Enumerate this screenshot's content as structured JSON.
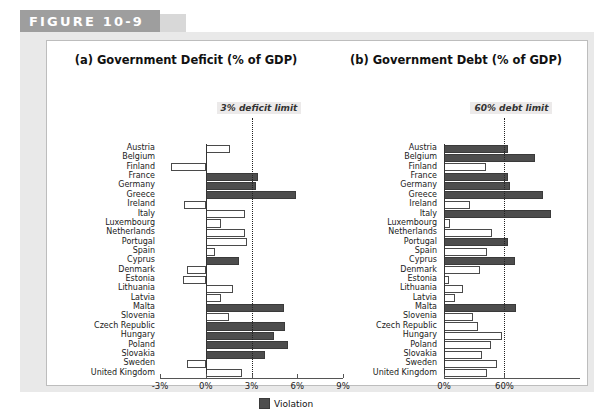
{
  "figure": {
    "tab_label": "FIGURE 10-9"
  },
  "legend": {
    "violation_label": "Violation",
    "violation_color": "#4d4d4d",
    "ok_color": "#ffffff"
  },
  "chart_data": [
    {
      "type": "bar",
      "orientation": "horizontal",
      "title": "(a) Government Deficit (% of GDP)",
      "xlabel": "",
      "ylabel": "",
      "xlim": [
        -3,
        9
      ],
      "xticks": [
        -3,
        0,
        3,
        6,
        9
      ],
      "xticklabels": [
        "-3%",
        "0%",
        "3%",
        "6%",
        "9%"
      ],
      "grid": false,
      "legend_position": "bottom-center",
      "annotation": "3% deficit limit",
      "threshold": 3,
      "threshold_style": "dotted-vertical",
      "categories": [
        "Austria",
        "Belgium",
        "Finland",
        "France",
        "Germany",
        "Greece",
        "Ireland",
        "Italy",
        "Luxembourg",
        "Netherlands",
        "Portugal",
        "Spain",
        "Cyprus",
        "Denmark",
        "Estonia",
        "Lithuania",
        "Latvia",
        "Malta",
        "Slovenia",
        "Czech Republic",
        "Hungary",
        "Poland",
        "Slovakia",
        "Sweden",
        "United Kingdom"
      ],
      "values": [
        1.6,
        0.0,
        -2.3,
        3.4,
        3.3,
        5.9,
        -1.4,
        2.6,
        1.0,
        2.6,
        2.7,
        0.6,
        2.2,
        -1.2,
        -1.5,
        1.8,
        1.0,
        5.1,
        1.5,
        5.2,
        4.5,
        5.4,
        3.9,
        -1.2,
        2.4
      ],
      "violation_flags": [
        false,
        false,
        false,
        true,
        true,
        true,
        false,
        false,
        false,
        false,
        false,
        false,
        true,
        false,
        false,
        false,
        false,
        true,
        false,
        true,
        true,
        true,
        true,
        false,
        false
      ]
    },
    {
      "type": "bar",
      "orientation": "horizontal",
      "title": "(b) Government Debt (% of GDP)",
      "xlabel": "",
      "ylabel": "",
      "xlim": [
        0,
        135
      ],
      "xticks": [
        0,
        60
      ],
      "xticklabels": [
        "0%",
        "60%"
      ],
      "grid": false,
      "legend_position": "bottom-center",
      "annotation": "60% debt limit",
      "threshold": 60,
      "threshold_style": "dotted-vertical",
      "categories": [
        "Austria",
        "Belgium",
        "Finland",
        "France",
        "Germany",
        "Greece",
        "Ireland",
        "Italy",
        "Luxembourg",
        "Netherlands",
        "Portugal",
        "Spain",
        "Cyprus",
        "Denmark",
        "Estonia",
        "Lithuania",
        "Latvia",
        "Malta",
        "Slovenia",
        "Czech Republic",
        "Hungary",
        "Poland",
        "Slovakia",
        "Sweden",
        "United Kingdom"
      ],
      "values": [
        63.8,
        90.0,
        42.0,
        64.0,
        66.0,
        98.0,
        26.0,
        106.0,
        6.0,
        48.0,
        64.0,
        43.0,
        70.0,
        36.0,
        4.5,
        19.0,
        11.0,
        71.0,
        29.0,
        34.0,
        58.0,
        47.0,
        38.0,
        53.0,
        43.0
      ],
      "violation_flags": [
        true,
        true,
        false,
        true,
        true,
        true,
        false,
        true,
        false,
        false,
        true,
        false,
        true,
        false,
        false,
        false,
        false,
        true,
        false,
        false,
        false,
        false,
        false,
        false,
        false
      ]
    }
  ]
}
